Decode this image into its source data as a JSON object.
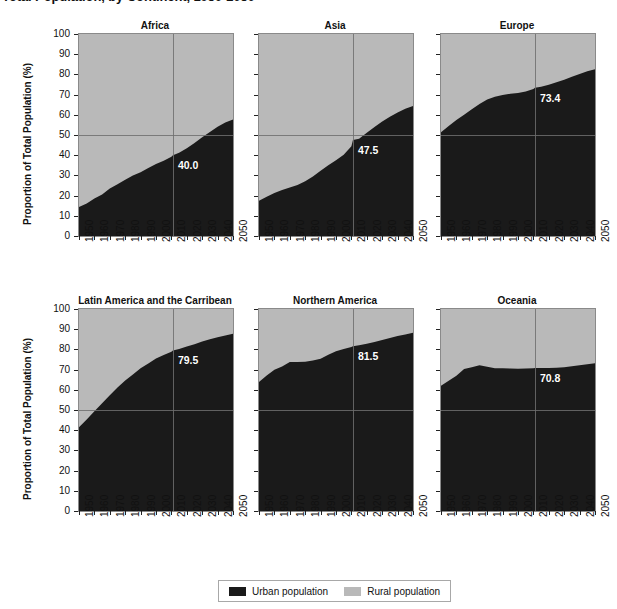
{
  "title": "Total Population, by Continent, 1950-2050",
  "axis": {
    "ylabel": "Proportion of Total Population (%)",
    "yticks": [
      0,
      10,
      20,
      30,
      40,
      50,
      60,
      70,
      80,
      90,
      100
    ],
    "xticks": [
      "1950",
      "1960",
      "1970",
      "1980",
      "1990",
      "2000",
      "2010",
      "2020",
      "2030",
      "2040",
      "2050"
    ],
    "ylim": [
      0,
      100
    ],
    "xlim": [
      1950,
      2050
    ],
    "grid": false
  },
  "legend": {
    "position": "bottom-center",
    "items": [
      {
        "label": "Urban population",
        "color": "#1a1a1a",
        "key": "urban"
      },
      {
        "label": "Rural population",
        "color": "#b9b9b9",
        "key": "rural"
      }
    ]
  },
  "reference": {
    "hline_value": 50,
    "vline_year": 2011,
    "color": "#6f6f6f"
  },
  "chart_data": {
    "type": "area",
    "stacked": true,
    "title": "Total Population, by Continent, 1950-2050",
    "xlabel": "",
    "ylabel": "Proportion of Total Population (%)",
    "ylim": [
      0,
      100
    ],
    "xlim": [
      1950,
      2050
    ],
    "x": [
      1950,
      1955,
      1960,
      1965,
      1970,
      1975,
      1980,
      1985,
      1990,
      1995,
      2000,
      2005,
      2010,
      2011,
      2015,
      2020,
      2025,
      2030,
      2035,
      2040,
      2045,
      2050
    ],
    "series_names": [
      "Urban population",
      "Rural population"
    ],
    "note": "Values are urban share of total population (%); rural share = 100 - urban.",
    "panels": [
      {
        "name": "Africa",
        "row": 0,
        "col": 0,
        "label_value": "40.0",
        "label_year": 2011,
        "urban": [
          14.4,
          16.1,
          18.6,
          20.6,
          23.5,
          25.6,
          27.9,
          30.0,
          31.5,
          33.7,
          35.6,
          37.3,
          39.2,
          40.0,
          41.2,
          43.5,
          46.1,
          48.9,
          51.5,
          54.1,
          56.2,
          57.7
        ]
      },
      {
        "name": "Asia",
        "row": 0,
        "col": 1,
        "label_value": "47.5",
        "label_year": 2011,
        "urban": [
          17.5,
          19.4,
          21.3,
          22.8,
          24.0,
          25.2,
          27.1,
          29.4,
          32.3,
          35.0,
          37.5,
          40.2,
          44.4,
          47.5,
          48.2,
          51.1,
          54.0,
          56.7,
          59.0,
          61.2,
          63.0,
          64.4
        ]
      },
      {
        "name": "Europe",
        "row": 0,
        "col": 2,
        "label_value": "73.4",
        "label_year": 2011,
        "urban": [
          51.3,
          54.4,
          57.4,
          60.0,
          62.8,
          65.3,
          67.6,
          68.9,
          69.8,
          70.4,
          70.8,
          71.5,
          72.8,
          73.4,
          73.9,
          74.9,
          76.1,
          77.4,
          78.8,
          80.2,
          81.5,
          82.6
        ]
      },
      {
        "name": "Latin America and the Carribean",
        "row": 1,
        "col": 0,
        "label_value": "79.5",
        "label_year": 2011,
        "urban": [
          41.4,
          45.3,
          49.4,
          53.4,
          57.3,
          61.1,
          64.6,
          67.6,
          70.7,
          73.0,
          75.5,
          77.2,
          78.8,
          79.5,
          80.2,
          81.4,
          82.6,
          83.9,
          85.0,
          86.0,
          86.9,
          87.8
        ]
      },
      {
        "name": "Northern America",
        "row": 1,
        "col": 1,
        "label_value": "81.5",
        "label_year": 2011,
        "urban": [
          63.9,
          67.1,
          69.9,
          71.5,
          73.8,
          73.8,
          73.9,
          74.5,
          75.4,
          77.3,
          79.1,
          80.2,
          81.2,
          81.5,
          82.0,
          82.8,
          83.7,
          84.7,
          85.7,
          86.6,
          87.4,
          88.2
        ]
      },
      {
        "name": "Oceania",
        "row": 1,
        "col": 2,
        "label_value": "70.8",
        "label_year": 2011,
        "urban": [
          62.0,
          64.5,
          66.9,
          70.3,
          71.2,
          72.2,
          71.4,
          70.7,
          70.7,
          70.5,
          70.4,
          70.5,
          70.7,
          70.8,
          70.8,
          70.8,
          70.9,
          71.2,
          71.6,
          72.1,
          72.6,
          73.2
        ]
      }
    ]
  }
}
